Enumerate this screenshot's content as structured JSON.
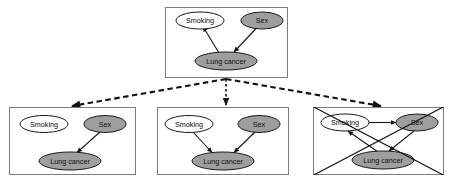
{
  "figure": {
    "type": "causal-dag-diagram",
    "background_color": "#ffffff",
    "node_fill_white": "#fdfdfd",
    "node_fill_gray": "#9e9e9e",
    "node_stroke": "#1a1a1a",
    "panel_stroke": "#7d7d7d",
    "edge_color": "#171717"
  },
  "panels": [
    {
      "id": "top",
      "role": "source-graph",
      "nodes": [
        {
          "id": "smoking",
          "label": "Smoking",
          "fill": "white"
        },
        {
          "id": "sex",
          "label": "Sex",
          "fill": "gray"
        },
        {
          "id": "lung_cancer",
          "label": "Lung cancer",
          "fill": "gray"
        }
      ],
      "edges": [
        {
          "from": "lung_cancer",
          "to": "smoking",
          "style": "solid",
          "arrow": true
        },
        {
          "from": "sex",
          "to": "lung_cancer",
          "style": "solid",
          "arrow": true
        }
      ],
      "crossed_out": false
    },
    {
      "id": "bottom-left",
      "role": "candidate-graph",
      "nodes": [
        {
          "id": "smoking",
          "label": "Smoking",
          "fill": "white"
        },
        {
          "id": "sex",
          "label": "Sex",
          "fill": "gray"
        },
        {
          "id": "lung_cancer",
          "label": "Lung cancer",
          "fill": "gray"
        }
      ],
      "edges": [
        {
          "from": "sex",
          "to": "lung_cancer",
          "style": "solid",
          "arrow": true
        }
      ],
      "crossed_out": false
    },
    {
      "id": "bottom-middle",
      "role": "candidate-graph",
      "nodes": [
        {
          "id": "smoking",
          "label": "Smoking",
          "fill": "white"
        },
        {
          "id": "sex",
          "label": "Sex",
          "fill": "gray"
        },
        {
          "id": "lung_cancer",
          "label": "Lung cancer",
          "fill": "gray"
        }
      ],
      "edges": [
        {
          "from": "smoking",
          "to": "lung_cancer",
          "style": "solid",
          "arrow": true
        },
        {
          "from": "sex",
          "to": "lung_cancer",
          "style": "solid",
          "arrow": true
        }
      ],
      "crossed_out": false
    },
    {
      "id": "bottom-right",
      "role": "rejected-graph",
      "nodes": [
        {
          "id": "smoking",
          "label": "Smoking",
          "fill": "white"
        },
        {
          "id": "sex",
          "label": "Sex",
          "fill": "gray"
        },
        {
          "id": "lung_cancer",
          "label": "Lung cancer",
          "fill": "gray"
        }
      ],
      "edges": [
        {
          "from": "smoking",
          "to": "sex",
          "style": "solid",
          "arrow": true
        },
        {
          "from": "lung_cancer",
          "to": "smoking",
          "style": "solid",
          "arrow": true
        },
        {
          "from": "sex",
          "to": "lung_cancer",
          "style": "solid",
          "arrow": true
        }
      ],
      "crossed_out": true
    }
  ],
  "connectors": [
    {
      "id": "to-left",
      "from": "top",
      "to": "bottom-left",
      "style": "dashed",
      "arrow": true
    },
    {
      "id": "to-middle",
      "from": "top",
      "to": "bottom-middle",
      "style": "dotted",
      "arrow": true
    },
    {
      "id": "to-right",
      "from": "top",
      "to": "bottom-right",
      "style": "dashed",
      "arrow": true
    }
  ],
  "labels": {
    "smoking": "Smoking",
    "sex": "Sex",
    "lung_cancer": "Lung cancer"
  }
}
